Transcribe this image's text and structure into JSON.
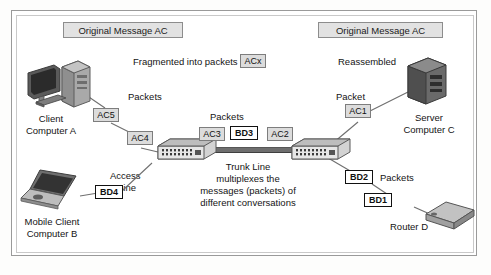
{
  "figure": {
    "title_left": "Original Message AC",
    "title_right": "Original Message AC",
    "fragmented_label": "Fragmented into packets",
    "fragmented_chip": "ACx",
    "reassembled_label": "Reassembled"
  },
  "nodes": {
    "client_a": {
      "line1": "Client",
      "line2": "Computer A",
      "icon": "desktop-computer-icon"
    },
    "mobile_b": {
      "line1": "Mobile Client",
      "line2": "Computer B",
      "icon": "laptop-computer-icon"
    },
    "server_c": {
      "line1": "Server",
      "line2": "Computer C",
      "icon": "server-tower-icon"
    },
    "router_d": {
      "line1": "Router D",
      "icon": "router-icon"
    },
    "switch_left": {
      "icon": "network-switch-icon"
    },
    "switch_right": {
      "icon": "network-switch-icon"
    }
  },
  "packets": [
    {
      "id": "ac5",
      "label": "AC5",
      "stream": "ac"
    },
    {
      "id": "ac4",
      "label": "AC4",
      "stream": "ac"
    },
    {
      "id": "ac3",
      "label": "AC3",
      "stream": "ac"
    },
    {
      "id": "ac2",
      "label": "AC2",
      "stream": "ac"
    },
    {
      "id": "ac1",
      "label": "AC1",
      "stream": "ac"
    },
    {
      "id": "bd4",
      "label": "BD4",
      "stream": "bd"
    },
    {
      "id": "bd3",
      "label": "BD3",
      "stream": "bd"
    },
    {
      "id": "bd2",
      "label": "BD2",
      "stream": "bd"
    },
    {
      "id": "bd1",
      "label": "BD1",
      "stream": "bd"
    }
  ],
  "captions": {
    "packets_left": "Packets",
    "packets_center": "Packets",
    "packets_right": "Packets",
    "packet_single": "Packet",
    "access_line_1": "Access",
    "access_line_2": "Line",
    "trunk_1": "Trunk Line",
    "trunk_2": "multiplexes the",
    "trunk_3": "messages (packets) of",
    "trunk_4": "different conversations"
  },
  "colors": {
    "ac_chip_fill": "#dcdcdc",
    "ac_chip_border": "#7d7d7d",
    "bd_chip_fill": "#ffffff",
    "bd_chip_border": "#111111",
    "header_fill": "#e2e2e2",
    "trunk_line": "#6e6e6e",
    "wire": "#6f6f6f"
  }
}
